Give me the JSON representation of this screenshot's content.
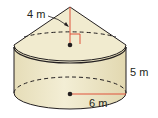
{
  "figure": {
    "type": "composite solid: cone on top of cylinder",
    "labels": {
      "cone_height": "4 m",
      "cylinder_height": "5 m",
      "radius": "6 m"
    },
    "colors": {
      "fill": "#efe8c8",
      "fill_shade": "#e3dab4",
      "outline": "#231f20",
      "measure_line": "#e0533a"
    }
  }
}
